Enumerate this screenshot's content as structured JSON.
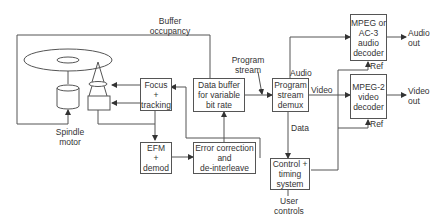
{
  "blocks": {
    "focus": "Focus\n+\ntracking",
    "buffer": "Data buffer\nfor variable\nbit rate",
    "demux": "Program\nstream\ndemux",
    "audio_decoder": "MPEG or\nAC-3\naudio\ndecoder",
    "video_decoder": "MPEG-2\nvideo\ndecoder",
    "efm": "EFM\n+\ndemod",
    "error": "Error correction\nand\nde-interleave",
    "control": "Control +\ntiming\nsystem"
  },
  "labels": {
    "buffer_occupancy": "Buffer\noccupancy",
    "program_stream": "Program\nstream",
    "audio": "Audio",
    "video": "Video",
    "data": "Data",
    "ref_audio": "Ref",
    "ref_video": "Ref",
    "audio_out": "Audio\nout",
    "video_out": "Video\nout",
    "spindle_motor": "Spindle\nmotor",
    "user_controls": "User\ncontrols"
  }
}
